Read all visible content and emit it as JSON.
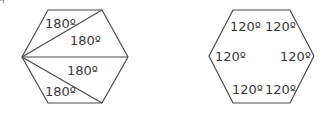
{
  "left_hexagon": {
    "description": "Hexagon divided into 4 triangles from one vertex",
    "labels": [
      "180º",
      "180º",
      "180º",
      "180º"
    ]
  },
  "right_hexagon": {
    "description": "Hexagon with interior angles labeled",
    "labels": [
      "120º",
      "120º",
      "120º",
      "120º",
      "120º",
      "120º"
    ]
  },
  "colors": {
    "stroke": "#4a4a4a",
    "text": "#3a3a3a"
  }
}
